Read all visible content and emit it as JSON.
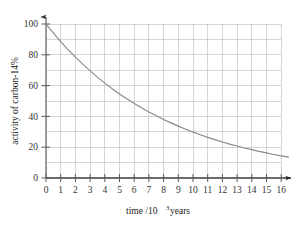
{
  "chart_data": {
    "type": "line",
    "title": "",
    "subtitle": "",
    "xlabel_parts": {
      "main": "time /10",
      "sup": "3",
      "tail": " years"
    },
    "xlabel": "time /10^3 years",
    "ylabel": "activity of carbon-14%",
    "xlim": [
      0,
      16
    ],
    "ylim": [
      0,
      100
    ],
    "x_ticks": [
      0,
      1,
      2,
      3,
      4,
      5,
      6,
      7,
      8,
      9,
      10,
      11,
      12,
      13,
      14,
      15,
      16
    ],
    "x_tick_labels": [
      "0",
      "1",
      "2",
      "3",
      "4",
      "5",
      "6",
      "7",
      "8",
      "9",
      "10",
      "11",
      "12",
      "13",
      "14",
      "15",
      "16"
    ],
    "y_ticks": [
      0,
      20,
      40,
      60,
      80,
      100
    ],
    "y_tick_labels": [
      "0",
      "20",
      "40",
      "60",
      "80",
      "100"
    ],
    "y_minor_ticks": [
      10,
      30,
      50,
      70,
      90
    ],
    "grid": true,
    "grid_color": "#b9b9c4",
    "legend": false,
    "legend_position": "none",
    "axis_arrows": true,
    "series": [
      {
        "name": "activity of carbon-14",
        "color": "#8a8a8a",
        "half_life": 5.7,
        "x": [
          0,
          0.5,
          1,
          1.5,
          2,
          2.5,
          3,
          3.5,
          4,
          4.5,
          5,
          5.5,
          6,
          6.5,
          7,
          7.5,
          8,
          8.5,
          9,
          9.5,
          10,
          10.5,
          11,
          11.5,
          12,
          12.5,
          13,
          13.5,
          14,
          14.5,
          15,
          15.5,
          16,
          16.5
        ],
        "values": [
          100.0,
          94.2,
          88.6,
          83.4,
          78.5,
          73.9,
          69.6,
          65.5,
          61.6,
          58.0,
          54.6,
          51.4,
          48.4,
          45.6,
          42.9,
          40.4,
          38.0,
          35.8,
          33.7,
          31.7,
          29.8,
          28.1,
          26.4,
          24.9,
          23.4,
          22.0,
          20.8,
          19.5,
          18.4,
          17.3,
          16.3,
          15.3,
          14.4,
          13.6
        ]
      }
    ]
  }
}
